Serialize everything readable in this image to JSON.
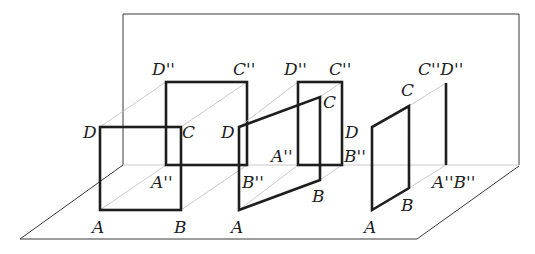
{
  "diagram": {
    "planes": {
      "back_wall": {
        "points": [
          [
            123,
            165
          ],
          [
            123,
            14
          ],
          [
            519,
            14
          ],
          [
            519,
            165
          ]
        ]
      },
      "floor": {
        "points": [
          [
            20,
            239
          ],
          [
            417,
            239
          ],
          [
            519,
            166
          ]
        ],
        "back_edge": [
          [
            123,
            165
          ],
          [
            519,
            165
          ]
        ],
        "left_edge": [
          [
            123,
            165
          ],
          [
            20,
            239
          ]
        ]
      }
    },
    "figures": [
      {
        "name": "case-1-square-parallel",
        "square": {
          "A": [
            100,
            210
          ],
          "B": [
            181,
            210
          ],
          "C": [
            181,
            127
          ],
          "D": [
            100,
            127
          ]
        },
        "projection": {
          "A''": [
            166,
            165
          ],
          "B''": [
            247,
            165
          ],
          "C''": [
            247,
            82
          ],
          "D''": [
            166,
            82
          ]
        },
        "labels": {
          "A": "A",
          "B": "B",
          "C": "C",
          "D": "D",
          "A2": "A''",
          "B2": "B''",
          "C2": "C''",
          "D2": "D''"
        }
      },
      {
        "name": "case-2-square-tilted",
        "square": {
          "A": [
            239,
            210
          ],
          "B": [
            320,
            180
          ],
          "C": [
            320,
            97
          ],
          "D": [
            239,
            127
          ]
        },
        "projection": {
          "A''": [
            298,
            165
          ],
          "B''": [
            342,
            165
          ],
          "C''": [
            342,
            82
          ],
          "D''": [
            298,
            82
          ]
        },
        "labels": {
          "A": "A",
          "B": "B",
          "C": "C",
          "D": "D",
          "A2": "A''",
          "B2": "B''",
          "C2": "C''",
          "D2": "D''"
        }
      },
      {
        "name": "case-3-square-perpendicular",
        "square": {
          "A": [
            372,
            210
          ],
          "B": [
            409,
            188
          ],
          "C": [
            409,
            106
          ],
          "D": [
            372,
            127
          ]
        },
        "projection": {
          "A''B''": [
            446,
            165
          ],
          "C''D''": [
            446,
            83
          ]
        },
        "labels": {
          "A": "A",
          "B": "B",
          "C": "C",
          "CD2": "C''D''",
          "AB2": "A''B''"
        }
      }
    ]
  }
}
